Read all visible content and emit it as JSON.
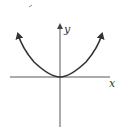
{
  "diagram": {
    "type": "parabola-graph",
    "axes": {
      "x_label": "x",
      "y_label": "y"
    },
    "curve": {
      "shape": "upward parabola",
      "vertex": "origin",
      "arrows_on_ends": true
    },
    "colors": {
      "axis": "#444444",
      "curve": "#333333"
    }
  }
}
